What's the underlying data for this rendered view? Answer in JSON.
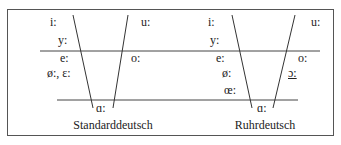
{
  "diagram": {
    "panels": [
      {
        "caption": "Standarddeutsch",
        "vowels": {
          "i": "i:",
          "y": "y:",
          "e": "e:",
          "oe_eps": "ø:, ɛ:",
          "u": "u:",
          "o": "o:",
          "a": "ɑ:"
        }
      },
      {
        "caption": "Ruhrdeutsch",
        "vowels": {
          "i": "i:",
          "y": "y:",
          "e": "e:",
          "oe": "ø:",
          "oelig": "œ:",
          "u": "u:",
          "o": "o:",
          "open_o": "ɔ:",
          "a": "ɑ:"
        }
      }
    ],
    "colors": {
      "line": "#333333",
      "text": "#222222",
      "frame": "#555555"
    }
  }
}
